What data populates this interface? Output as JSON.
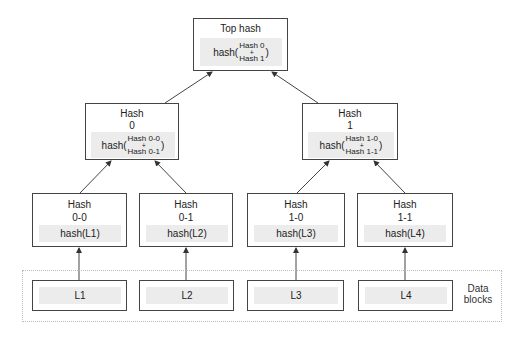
{
  "diagram": {
    "type": "merkle-tree",
    "top": {
      "title": "Top hash",
      "fn": "hash(",
      "a": "Hash 0",
      "plus": "+",
      "b": "Hash 1",
      "close": ")"
    },
    "level1": [
      {
        "title1": "Hash",
        "title2": "0",
        "fn": "hash(",
        "a": "Hash 0-0",
        "plus": "+",
        "b": "Hash 0-1",
        "close": ")"
      },
      {
        "title1": "Hash",
        "title2": "1",
        "fn": "hash(",
        "a": "Hash 1-0",
        "plus": "+",
        "b": "Hash 1-1",
        "close": ")"
      }
    ],
    "leaves": [
      {
        "title1": "Hash",
        "title2": "0-0",
        "fn": "hash(L1)"
      },
      {
        "title1": "Hash",
        "title2": "0-1",
        "fn": "hash(L2)"
      },
      {
        "title1": "Hash",
        "title2": "1-0",
        "fn": "hash(L3)"
      },
      {
        "title1": "Hash",
        "title2": "1-1",
        "fn": "hash(L4)"
      }
    ],
    "data_blocks": [
      "L1",
      "L2",
      "L3",
      "L4"
    ],
    "data_label_line1": "Data",
    "data_label_line2": "blocks",
    "colors": {
      "border": "#444444",
      "band": "#ececec",
      "container_border": "#bbbbbb"
    }
  }
}
